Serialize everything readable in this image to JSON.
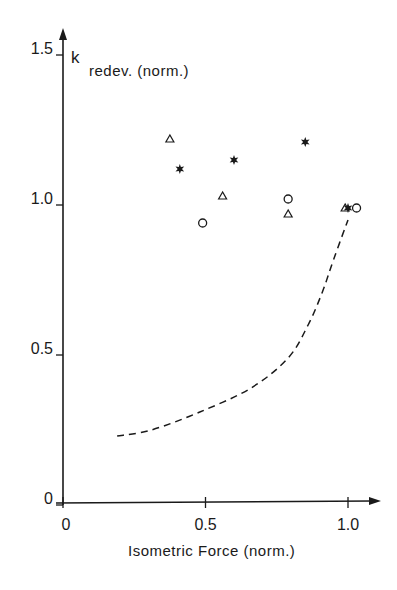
{
  "chart_data": {
    "type": "scatter",
    "title": "",
    "xlabel": "Isometric Force (norm.)",
    "ylabel_main": "k",
    "ylabel_sub": "redev. (norm.)",
    "xlim": [
      0,
      1.1
    ],
    "ylim": [
      0,
      1.55
    ],
    "grid": false,
    "legend": "none",
    "x_ticks": [
      {
        "value": 0,
        "label": "0"
      },
      {
        "value": 0.5,
        "label": "0.5"
      },
      {
        "value": 1.0,
        "label": "1.0"
      }
    ],
    "y_ticks": [
      {
        "value": 0,
        "label": "0"
      },
      {
        "value": 0.5,
        "label": "0.5"
      },
      {
        "value": 1.0,
        "label": "1.0"
      },
      {
        "value": 1.5,
        "label": "1.5"
      }
    ],
    "series": [
      {
        "name": "triangles",
        "marker": "open-triangle",
        "points": [
          [
            0.375,
            1.22
          ],
          [
            0.56,
            1.03
          ],
          [
            0.79,
            0.97
          ],
          [
            0.99,
            0.99
          ]
        ]
      },
      {
        "name": "stars",
        "marker": "filled-star",
        "points": [
          [
            0.41,
            1.12
          ],
          [
            0.6,
            1.15
          ],
          [
            0.85,
            1.21
          ],
          [
            1.0,
            0.99
          ]
        ]
      },
      {
        "name": "circles",
        "marker": "open-circle",
        "points": [
          [
            0.49,
            0.94
          ],
          [
            0.79,
            1.02
          ],
          [
            1.03,
            0.99
          ]
        ]
      },
      {
        "name": "dashed-curve",
        "marker": "dashed-line",
        "points": [
          [
            0.19,
            0.23
          ],
          [
            0.31,
            0.25
          ],
          [
            0.48,
            0.31
          ],
          [
            0.66,
            0.39
          ],
          [
            0.79,
            0.49
          ],
          [
            0.86,
            0.6
          ],
          [
            0.91,
            0.71
          ],
          [
            0.95,
            0.82
          ],
          [
            1.0,
            0.95
          ]
        ]
      }
    ]
  },
  "colors": {
    "ink": "#1a1a1a",
    "background": "#ffffff"
  }
}
